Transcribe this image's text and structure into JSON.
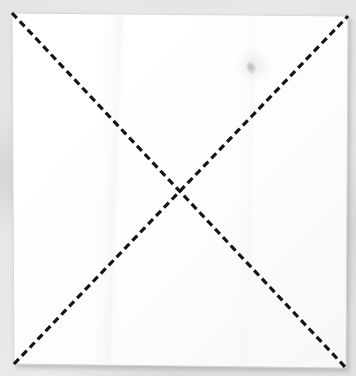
{
  "scene": {
    "title": "Square sheet of paper with two dashed diagonal fold lines",
    "width": 356,
    "height": 376,
    "backdrop_color": "#e9e9e9",
    "backdrop_label": "grey table surface"
  },
  "paper": {
    "label": "square paper sheet",
    "fill_color": "#ffffff",
    "edge_color": "#d2d2d2",
    "shadow_color": "rgba(120,120,120,0.45)",
    "corners": {
      "top_left": [
        12,
        13
      ],
      "top_right": [
        348,
        16
      ],
      "bottom_right": [
        346,
        368
      ],
      "bottom_left": [
        14,
        364
      ]
    }
  },
  "creases": {
    "label": "dashed diagonal crease lines",
    "stroke_color": "#141414",
    "stroke_width": 3.2,
    "dash_length": 7,
    "dash_gap": 4.4,
    "count": 2,
    "lines": [
      {
        "name": "crease-top-left-to-bottom-right",
        "from": [
          12,
          13
        ],
        "to": [
          346,
          368
        ],
        "description": "diagonal from top-left corner to bottom-right corner"
      },
      {
        "name": "crease-bottom-left-to-top-right",
        "from": [
          14,
          364
        ],
        "to": [
          348,
          16
        ],
        "description": "diagonal from bottom-left corner to top-right corner"
      }
    ],
    "intersection": [
      180,
      190
    ]
  },
  "marks": [
    {
      "name": "smudge-mark",
      "label": "faint grey smudge",
      "position": [
        252,
        68
      ],
      "color": "#96969a"
    }
  ]
}
